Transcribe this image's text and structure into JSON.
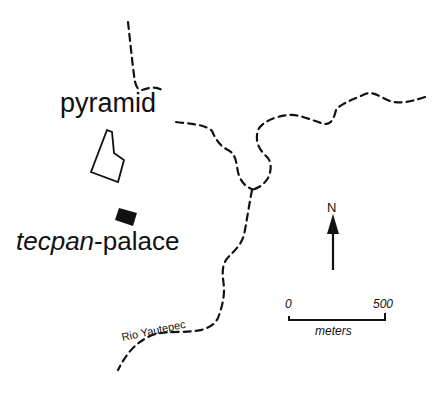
{
  "map": {
    "features": {
      "pyramid": {
        "label": "pyramid"
      },
      "palace": {
        "label_italic": "tecpan",
        "label_rest": "-palace"
      },
      "river": {
        "label": "Rio Yautepec"
      }
    },
    "north_arrow": {
      "label": "N"
    },
    "scale_bar": {
      "start": "0",
      "end": "500",
      "units": "meters"
    },
    "colors": {
      "ink": "#111111",
      "background": "#ffffff"
    }
  }
}
